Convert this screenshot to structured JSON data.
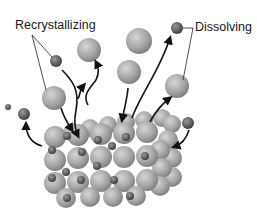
{
  "labels": {
    "recrystallizing": "Recrystallizing",
    "dissolving": "Dissolving"
  },
  "colors": {
    "large_ion": "#a8a8a8",
    "small_ion": "#6b6b6b",
    "arrow": "#111111"
  }
}
